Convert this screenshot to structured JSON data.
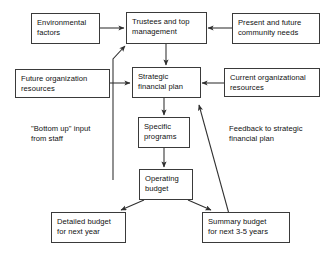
{
  "diagram": {
    "stroke_color": "#3a3a3a",
    "text_color": "#111111",
    "background": "#ffffff",
    "nodes": [
      {
        "id": "environmental-factors",
        "line1": "Environmental",
        "line2": "factors"
      },
      {
        "id": "trustees-top-management",
        "line1": "Trustees and top",
        "line2": "management"
      },
      {
        "id": "present-future-needs",
        "line1": "Present and future",
        "line2": "community needs"
      },
      {
        "id": "future-org-resources",
        "line1": "Future organization",
        "line2": "resources"
      },
      {
        "id": "strategic-financial-plan",
        "line1": "Strategic",
        "line2": "financial plan"
      },
      {
        "id": "current-org-resources",
        "line1": "Current organizational",
        "line2": "resources"
      },
      {
        "id": "specific-programs",
        "line1": "Specific",
        "line2": "programs"
      },
      {
        "id": "operating-budget",
        "line1": "Operating",
        "line2": "budget"
      },
      {
        "id": "detailed-budget",
        "line1": "Detailed budget",
        "line2": "for next year"
      },
      {
        "id": "summary-budget",
        "line1": "Summary budget",
        "line2": "for next 3-5 years"
      }
    ],
    "annotations": [
      {
        "id": "bottom-up-input",
        "line1": "\"Bottom up\" input",
        "line2": "from staff"
      },
      {
        "id": "feedback-note",
        "line1": "Feedback to strategic",
        "line2": "financial plan"
      }
    ],
    "edges": [
      {
        "from": "environmental-factors",
        "to": "trustees-top-management",
        "direction": "right"
      },
      {
        "from": "present-future-needs",
        "to": "trustees-top-management",
        "direction": "left"
      },
      {
        "from": "trustees-top-management",
        "to": "strategic-financial-plan",
        "direction": "down"
      },
      {
        "from": "future-org-resources",
        "to": "strategic-financial-plan",
        "direction": "right"
      },
      {
        "from": "current-org-resources",
        "to": "strategic-financial-plan",
        "direction": "left"
      },
      {
        "from": "strategic-financial-plan",
        "to": "specific-programs",
        "direction": "down"
      },
      {
        "from": "specific-programs",
        "to": "operating-budget",
        "direction": "down"
      },
      {
        "from": "operating-budget",
        "to": "detailed-budget",
        "direction": "down-left"
      },
      {
        "from": "operating-budget",
        "to": "summary-budget",
        "direction": "down-right"
      },
      {
        "from": "bottom-up-input",
        "to": "trustees-top-management",
        "direction": "up-right"
      },
      {
        "from": "summary-budget",
        "to": "strategic-financial-plan",
        "direction": "up-left"
      }
    ]
  }
}
